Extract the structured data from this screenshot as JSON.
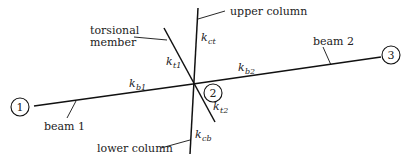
{
  "diagram": {
    "type": "structural joint model (equivalent frame)",
    "nodes": [
      {
        "id": "node-1",
        "label": "1"
      },
      {
        "id": "node-2",
        "label": "2"
      },
      {
        "id": "node-3",
        "label": "3"
      }
    ],
    "members": {
      "beam1": {
        "label": "beam 1",
        "stiffness": "k",
        "stiffness_sub": "b1"
      },
      "beam2": {
        "label": "beam 2",
        "stiffness": "k",
        "stiffness_sub": "b2"
      },
      "upper_column": {
        "label": "upper column",
        "stiffness": "k",
        "stiffness_sub": "ct"
      },
      "lower_column": {
        "label": "lower column",
        "stiffness": "k",
        "stiffness_sub": "cb"
      },
      "torsional": {
        "label_line1": "torsional",
        "label_line2": "member",
        "stiffness_top": "k",
        "stiffness_top_sub": "t1",
        "stiffness_bottom": "k",
        "stiffness_bottom_sub": "t2"
      }
    },
    "colors": {
      "line": "#111111",
      "text": "#222222",
      "background": "#ffffff"
    }
  }
}
